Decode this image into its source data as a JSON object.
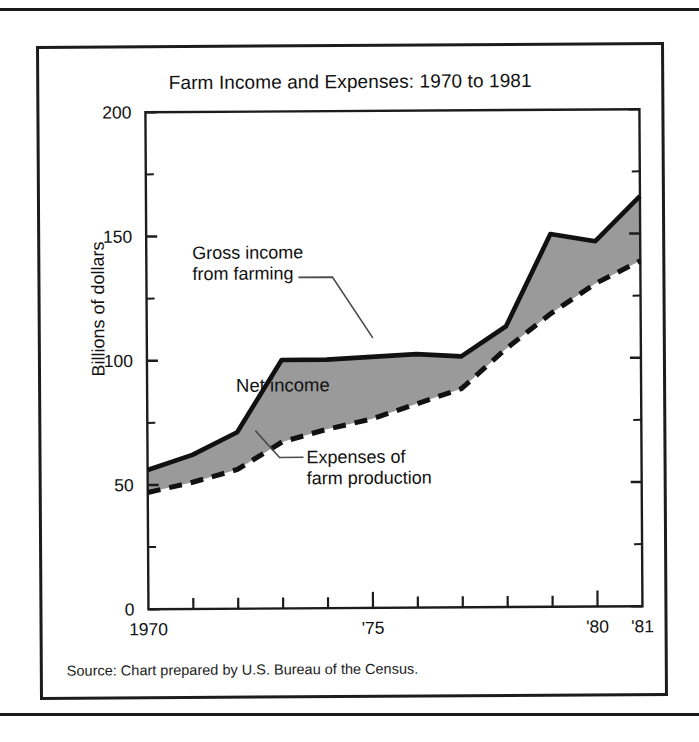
{
  "figure": {
    "title": "Farm Income and Expenses: 1970 to 1981",
    "source": "Source: Chart prepared by U.S. Bureau of the Census.",
    "ylabel": "Billions of dollars",
    "annotations": {
      "gross": "Gross income\nfrom farming",
      "net": "Net income",
      "expenses": "Expenses of\nfarm production"
    }
  },
  "chart_data": {
    "type": "area",
    "title": "Farm Income and Expenses: 1970 to 1981",
    "subtitle": "",
    "xlabel": "",
    "ylabel": "Billions of dollars",
    "x": [
      1970,
      1971,
      1972,
      1973,
      1974,
      1975,
      1976,
      1977,
      1978,
      1979,
      1980,
      1981
    ],
    "xtick_labels": [
      "1970",
      "",
      "",
      "",
      "",
      "'75",
      "",
      "",
      "",
      "",
      "'80",
      "'81"
    ],
    "xtick_values": [
      1970,
      1971,
      1972,
      1973,
      1974,
      1975,
      1976,
      1977,
      1978,
      1979,
      1980,
      1981
    ],
    "ytick_labels": [
      "0",
      "50",
      "100",
      "150",
      "200"
    ],
    "ytick_values": [
      0,
      50,
      100,
      150,
      200
    ],
    "yminor_values": [
      25,
      75,
      125,
      175
    ],
    "ylim": [
      0,
      200
    ],
    "xlim": [
      1970,
      1981
    ],
    "grid": false,
    "legend": "annotated inline",
    "series": [
      {
        "name": "Gross income from farming",
        "style": "solid",
        "values": [
          56,
          62,
          71,
          100,
          100,
          101,
          102,
          101,
          113,
          150,
          147,
          165
        ]
      },
      {
        "name": "Expenses of farm production",
        "style": "dashed",
        "values": [
          47,
          51,
          56,
          67,
          72,
          76,
          82,
          88,
          104,
          118,
          130,
          139
        ]
      }
    ],
    "shaded_band": {
      "name": "Net income",
      "between": [
        "Gross income from farming",
        "Expenses of farm production"
      ],
      "fill_color": "#9a9a9a"
    },
    "colors": {
      "band_fill": "#9a9a9a",
      "line": "#111111",
      "axis": "#1c1c1c"
    }
  }
}
